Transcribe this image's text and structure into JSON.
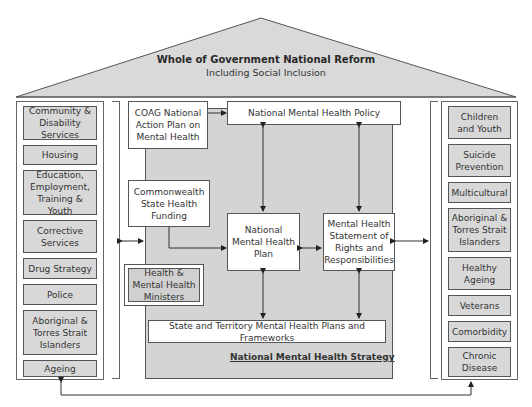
{
  "roof": {
    "title": "Whole of Government National Reform",
    "subtitle": "Including Social Inclusion"
  },
  "left_pillar": {
    "items": [
      {
        "label": "Community & Disability Services"
      },
      {
        "label": "Housing"
      },
      {
        "label": "Education, Employment, Training & Youth"
      },
      {
        "label": "Corrective Services"
      },
      {
        "label": "Drug Strategy"
      },
      {
        "label": "Police"
      },
      {
        "label": "Aboriginal & Torres Strait Islanders"
      },
      {
        "label": "Ageing"
      }
    ]
  },
  "right_pillar": {
    "items": [
      {
        "label": "Children and Youth"
      },
      {
        "label": "Suicide Prevention"
      },
      {
        "label": "Multicultural"
      },
      {
        "label": "Aboriginal & Torres Strait Islanders"
      },
      {
        "label": "Healthy Ageing"
      },
      {
        "label": "Veterans"
      },
      {
        "label": "Comorbidity"
      },
      {
        "label": "Chronic Disease"
      }
    ]
  },
  "center": {
    "coag": "COAG National Action Plan on Mental Health",
    "funding": "Commonwealth State Health Funding",
    "ministers": "Health & Mental Health Ministers",
    "policy": "National Mental Health Policy",
    "plan": "National Mental Health Plan",
    "statement": "Mental Health Statement of Rights and Responsibilities",
    "state_plans": "State and Territory Mental Health Plans and Frameworks",
    "strategy_label": "National Mental Health Strategy"
  },
  "colors": {
    "roof_fill": "#d9d9d9",
    "box_fill": "#d8d8d8",
    "center_fill": "#d4d4d4",
    "border": "#555555"
  }
}
